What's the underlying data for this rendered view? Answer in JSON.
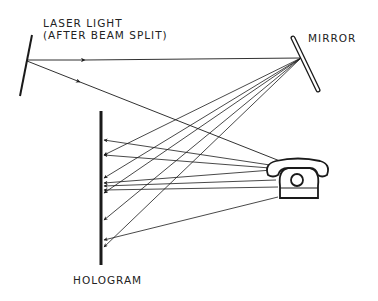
{
  "labels": {
    "laser_line1": "LASER LIGHT",
    "laser_line2": "(AFTER BEAM SPLIT)",
    "mirror": "MIRROR",
    "hologram": "HOLOGRAM"
  },
  "components": [
    "laser-source",
    "mirror",
    "object-telephone",
    "hologram-plate"
  ],
  "colors": {
    "ink": "#1a1a1a",
    "background": "#ffffff"
  }
}
